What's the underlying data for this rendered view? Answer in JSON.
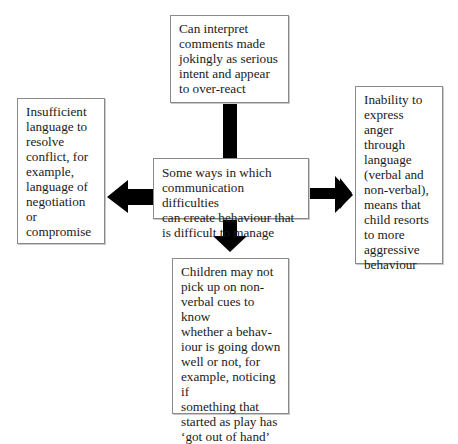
{
  "diagram": {
    "title": "Some ways in which communication difficulties can create behaviour that is difficult to manage",
    "center": {
      "text": "Some ways in which\ncommunication difficulties\ncan create behaviour that\nis difficult to manage"
    },
    "nodes": {
      "top": {
        "text": "Can interpret\ncomments made\njokingly as serious\nintent and appear\nto over-react"
      },
      "left": {
        "text": "Insufficient\nlanguage to\nresolve\nconflict, for\nexample,\nlanguage of\nnegotiation\nor\ncompromise"
      },
      "right": {
        "text": "Inability to\nexpress anger\nthrough\nlanguage\n(verbal and\nnon-verbal),\nmeans that\nchild resorts\nto more\naggressive\nbehaviour"
      },
      "bottom": {
        "text": "Children may not\npick up on non-\nverbal cues to know\nwhether a behav-\niour is going down\nwell or not, for\nexample, noticing if\nsomething that\nstarted as play has\n‘got out of hand’"
      }
    },
    "edges": [
      {
        "from": "center",
        "to": "top",
        "style": "connector"
      },
      {
        "from": "center",
        "to": "left",
        "style": "arrow"
      },
      {
        "from": "center",
        "to": "right",
        "style": "arrow"
      },
      {
        "from": "center",
        "to": "bottom",
        "style": "arrow"
      }
    ],
    "colors": {
      "arrow": "#000000",
      "box_border": "#8a8a8a",
      "text": "#1a1a1a"
    }
  }
}
